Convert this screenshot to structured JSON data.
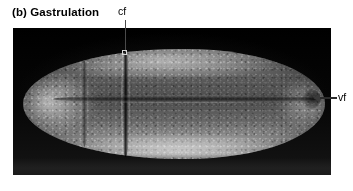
{
  "figure": {
    "panel_letter": "(b)",
    "caption": "(b) Gastrulation",
    "background_color": "#ffffff",
    "plate_color": "#050505"
  },
  "annotations": [
    {
      "id": "cf",
      "label": "cf",
      "meaning": "cephalic furrow",
      "pointer_style": "leader-line-with-square-marker",
      "label_x": 118,
      "label_y": 5,
      "target_x": 125,
      "target_y": 52
    },
    {
      "id": "vf",
      "label": "vf",
      "meaning": "ventral furrow",
      "pointer_style": "left-arrow",
      "label_x": 338,
      "label_y": 91,
      "target_x": 314,
      "target_y": 98
    }
  ],
  "micrograph": {
    "type": "scanning-electron-micrograph",
    "subject": "Drosophila embryo during gastrulation",
    "orientation": "anterior-left-posterior-right",
    "panel": {
      "x": 13,
      "y": 28,
      "width": 318,
      "height": 147
    }
  }
}
